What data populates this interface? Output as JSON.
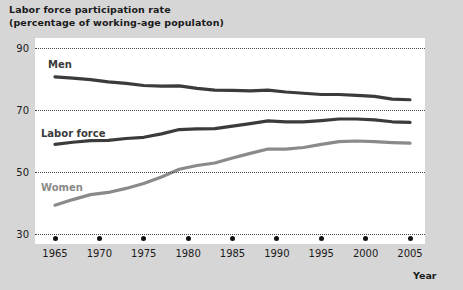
{
  "title": {
    "line1": "Labor force participation rate",
    "line2": "(percentage of working-age populaton)"
  },
  "axis": {
    "x_axis_label": "Year",
    "y_ticks": [
      "90",
      "70",
      "50",
      "30"
    ],
    "x_ticks": [
      "1965",
      "1970",
      "1975",
      "1980",
      "1985",
      "1990",
      "1995",
      "2000",
      "2005"
    ]
  },
  "series_labels": {
    "men": "Men",
    "labor_force": "Labor force",
    "women": "Women"
  },
  "colors": {
    "dark_line": "#3b3b3b",
    "light_line": "#8a8a8a",
    "plot_background": "#ffffff",
    "page_background": "#d6d6d6",
    "text": "#1a1a1a"
  },
  "chart_data": {
    "type": "line",
    "title": "Labor force participation rate (percentage of working-age populaton)",
    "xlabel": "Year",
    "ylabel": "percentage of working-age population",
    "xlim": [
      1965,
      2005
    ],
    "ylim": [
      30,
      90
    ],
    "yticks": [
      30,
      50,
      70,
      90
    ],
    "xticks": [
      1965,
      1970,
      1975,
      1980,
      1985,
      1990,
      1995,
      2000,
      2005
    ],
    "grid": "horizontal-dotted",
    "legend": "inline-labels",
    "x": [
      1965,
      1967,
      1969,
      1971,
      1973,
      1975,
      1977,
      1979,
      1981,
      1983,
      1985,
      1987,
      1989,
      1991,
      1993,
      1995,
      1997,
      1999,
      2001,
      2003,
      2005
    ],
    "series": [
      {
        "name": "Men",
        "color": "#3b3b3b",
        "values": [
          80.7,
          80.3,
          79.8,
          79.1,
          78.6,
          77.9,
          77.7,
          77.8,
          77.0,
          76.4,
          76.3,
          76.2,
          76.4,
          75.8,
          75.4,
          75.0,
          75.0,
          74.7,
          74.4,
          73.5,
          73.3
        ]
      },
      {
        "name": "Labor force",
        "color": "#3b3b3b",
        "values": [
          58.9,
          59.6,
          60.1,
          60.2,
          60.8,
          61.2,
          62.3,
          63.7,
          63.9,
          64.0,
          64.8,
          65.6,
          66.5,
          66.2,
          66.2,
          66.6,
          67.1,
          67.1,
          66.8,
          66.2,
          66.0
        ]
      },
      {
        "name": "Women",
        "color": "#8a8a8a",
        "values": [
          39.3,
          41.1,
          42.7,
          43.4,
          44.7,
          46.3,
          48.4,
          50.9,
          52.1,
          52.9,
          54.5,
          56.0,
          57.4,
          57.4,
          57.9,
          58.9,
          59.8,
          60.0,
          59.8,
          59.5,
          59.3
        ]
      }
    ]
  }
}
